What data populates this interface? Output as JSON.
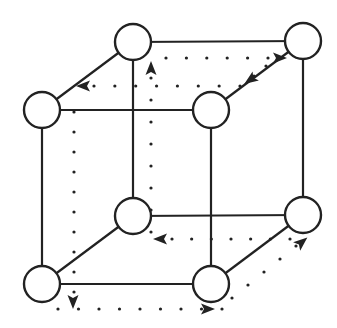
{
  "diagram": {
    "type": "cube-graph-hamiltonian-path",
    "colors": {
      "stroke": "#222222",
      "node_fill": "#ffffff",
      "background": "#ffffff"
    },
    "node_radius": 18,
    "nodes": [
      {
        "id": "top-back-left",
        "x": 133,
        "y": 42
      },
      {
        "id": "top-back-right",
        "x": 303,
        "y": 41
      },
      {
        "id": "top-front-left",
        "x": 42,
        "y": 110
      },
      {
        "id": "top-front-right",
        "x": 211,
        "y": 110
      },
      {
        "id": "bottom-back-left",
        "x": 133,
        "y": 216
      },
      {
        "id": "bottom-back-right",
        "x": 303,
        "y": 215
      },
      {
        "id": "bottom-front-left",
        "x": 42,
        "y": 284
      },
      {
        "id": "bottom-front-right",
        "x": 211,
        "y": 284
      }
    ],
    "edges": [
      [
        "top-back-left",
        "top-back-right"
      ],
      [
        "top-front-left",
        "top-front-right"
      ],
      [
        "top-back-left",
        "top-front-left"
      ],
      [
        "top-back-right",
        "top-front-right"
      ],
      [
        "bottom-back-left",
        "bottom-back-right"
      ],
      [
        "bottom-front-left",
        "bottom-front-right"
      ],
      [
        "bottom-back-left",
        "bottom-front-left"
      ],
      [
        "bottom-back-right",
        "bottom-front-right"
      ],
      [
        "top-back-left",
        "bottom-back-left"
      ],
      [
        "top-back-right",
        "bottom-back-right"
      ],
      [
        "top-front-left",
        "bottom-front-left"
      ],
      [
        "top-front-right",
        "bottom-front-right"
      ]
    ],
    "dotted_path": [
      {
        "from": [
          74,
          112
        ],
        "to": [
          74,
          292
        ],
        "arrow": "down",
        "arrow_at": [
          73,
          302
        ]
      },
      {
        "from": [
          58,
          309
        ],
        "to": [
          222,
          309
        ],
        "arrow": "right",
        "arrow_at": [
          208,
          309
        ]
      },
      {
        "from": [
          232,
          298
        ],
        "to": [
          296,
          246
        ],
        "arrow": "up-right",
        "arrow_at": [
          302,
          242
        ]
      },
      {
        "from": [
          290,
          239
        ],
        "to": [
          172,
          239
        ],
        "arrow": "left",
        "arrow_at": [
          160,
          239
        ]
      },
      {
        "from": [
          151,
          232
        ],
        "to": [
          151,
          78
        ],
        "arrow": "up",
        "arrow_at": [
          151,
          68
        ]
      },
      {
        "from": [
          166,
          58
        ],
        "to": [
          268,
          58
        ],
        "arrow": "right",
        "arrow_at": [
          280,
          58
        ]
      },
      {
        "from": [
          266,
          66
        ],
        "to": [
          254,
          76
        ],
        "arrow": "down-left",
        "arrow_at": [
          250,
          80
        ]
      },
      {
        "from": [
          240,
          86
        ],
        "to": [
          94,
          86
        ],
        "arrow": "left",
        "arrow_at": [
          83,
          86
        ]
      }
    ]
  }
}
